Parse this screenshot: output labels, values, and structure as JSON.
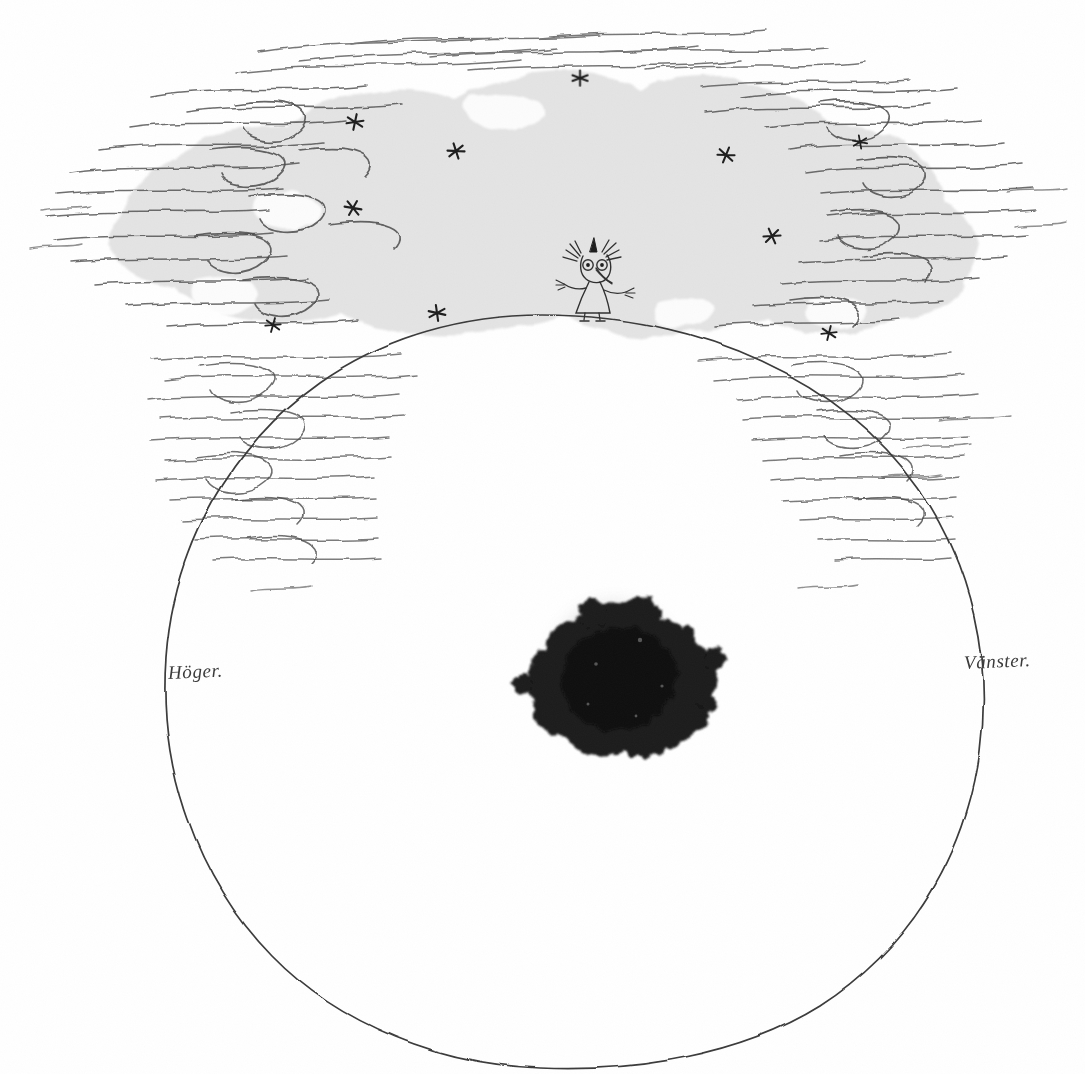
{
  "artwork": {
    "title": "Cloud over sphere with ink blot",
    "medium": "pen-and-ink drawing with grey wash",
    "background_color": "#ffffff",
    "ink_color": "#2b2b2b",
    "wash_color": "#e3e3e3",
    "blot_color": "#1a1a1a"
  },
  "labels": {
    "left": "Höger.",
    "right": "Vänster."
  },
  "figure": {
    "name": "standing-figure"
  },
  "blot": {
    "name": "ink-blot",
    "description": "dense black ink blot with two bumps at top"
  },
  "sphere": {
    "name": "large-circle",
    "description": "large hand-drawn circle outline"
  },
  "cloud": {
    "name": "cloud-wash",
    "description": "irregular grey wash surrounded by feathered pen hatching"
  },
  "stars": [
    {
      "x": 580,
      "y": 78
    },
    {
      "x": 355,
      "y": 122
    },
    {
      "x": 456,
      "y": 151
    },
    {
      "x": 726,
      "y": 155
    },
    {
      "x": 860,
      "y": 142
    },
    {
      "x": 353,
      "y": 208
    },
    {
      "x": 772,
      "y": 236
    },
    {
      "x": 273,
      "y": 325
    },
    {
      "x": 437,
      "y": 313
    },
    {
      "x": 829,
      "y": 333
    }
  ]
}
